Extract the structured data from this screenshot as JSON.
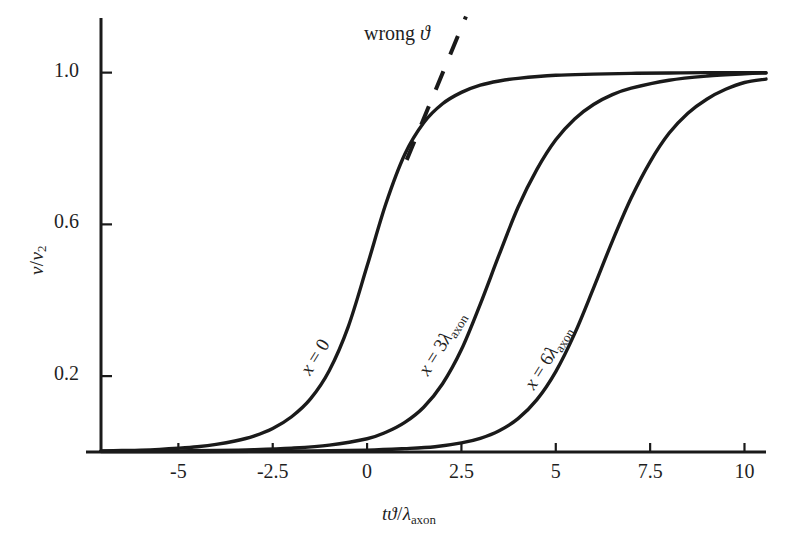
{
  "chart_data": {
    "type": "line",
    "title": "",
    "xlabel": "tϑ/λ_axon",
    "ylabel": "v/v_2",
    "xlim": [
      -7.05,
      10.57
    ],
    "ylim": [
      0.0,
      1.144
    ],
    "grid": false,
    "legend_position": "inline-curve-labels",
    "xticks": [
      -5,
      -2.5,
      0,
      2.5,
      5,
      7.5,
      10
    ],
    "xtick_labels": [
      "-5",
      "-2.5",
      "0",
      "2.5",
      "5",
      "7.5",
      "10"
    ],
    "yticks": [
      0.2,
      0.6,
      1.0
    ],
    "ytick_labels": [
      "0.2",
      "0.6",
      "1.0"
    ],
    "series": [
      {
        "name": "x = 0",
        "label": "x = 0",
        "style": "solid",
        "color": "#1a1a1a",
        "x": [
          -7.05,
          -6.5,
          -6.0,
          -5.5,
          -5.0,
          -4.5,
          -4.0,
          -3.5,
          -3.0,
          -2.5,
          -2.0,
          -1.5,
          -1.0,
          -0.5,
          0.0,
          0.5,
          1.0,
          1.5,
          2.0,
          2.5,
          3.0,
          3.5,
          4.0,
          5.0,
          6.0,
          7.0,
          8.0,
          9.0,
          10.0,
          10.57
        ],
        "y": [
          0.003,
          0.004,
          0.005,
          0.007,
          0.01,
          0.014,
          0.02,
          0.029,
          0.042,
          0.062,
          0.093,
          0.14,
          0.215,
          0.33,
          0.49,
          0.655,
          0.785,
          0.868,
          0.918,
          0.948,
          0.967,
          0.978,
          0.985,
          0.993,
          0.996,
          0.998,
          0.999,
          1.0,
          1.0,
          1.0
        ]
      },
      {
        "name": "x = 3λ_axon",
        "label": "x = 3λ_axon",
        "style": "solid",
        "color": "#1a1a1a",
        "x": [
          -7.05,
          -6.0,
          -5.0,
          -4.0,
          -3.0,
          -2.0,
          -1.0,
          0.0,
          0.5,
          1.0,
          1.5,
          2.0,
          2.5,
          3.0,
          3.5,
          4.0,
          4.5,
          5.0,
          5.5,
          6.0,
          6.5,
          7.0,
          8.0,
          9.0,
          10.0,
          10.57
        ],
        "y": [
          0.002,
          0.002,
          0.003,
          0.004,
          0.006,
          0.01,
          0.018,
          0.035,
          0.052,
          0.078,
          0.118,
          0.18,
          0.27,
          0.39,
          0.52,
          0.645,
          0.745,
          0.823,
          0.878,
          0.916,
          0.942,
          0.959,
          0.98,
          0.991,
          0.997,
          0.999
        ]
      },
      {
        "name": "x = 6λ_axon",
        "label": "x = 6λ_axon",
        "style": "solid",
        "color": "#1a1a1a",
        "x": [
          -7.05,
          -5.0,
          -3.0,
          -1.5,
          0.0,
          1.0,
          1.8,
          2.5,
          3.0,
          3.5,
          4.0,
          4.5,
          5.0,
          5.5,
          6.0,
          6.5,
          7.0,
          7.5,
          8.0,
          8.5,
          9.0,
          9.5,
          10.0,
          10.57
        ],
        "y": [
          0.001,
          0.001,
          0.002,
          0.003,
          0.005,
          0.009,
          0.014,
          0.024,
          0.036,
          0.056,
          0.088,
          0.138,
          0.212,
          0.312,
          0.432,
          0.556,
          0.67,
          0.765,
          0.84,
          0.893,
          0.93,
          0.956,
          0.974,
          0.983
        ]
      }
    ],
    "annotations": [
      {
        "name": "wrong-theta",
        "text": "wrong ϑ",
        "style": "dashed",
        "color": "#1a1a1a",
        "line_x": [
          1.05,
          2.62
        ],
        "line_y": [
          0.77,
          1.148
        ],
        "text_x": 0.4,
        "text_y": 1.125
      }
    ]
  },
  "axes": {
    "x_axis_name": "x-axis",
    "y_axis_name": "y-axis",
    "ylabel_parts": {
      "num": "v",
      "slash": "/",
      "den": "v",
      "den_sub": "2"
    },
    "xlabel_parts": {
      "t": "t",
      "theta": "ϑ",
      "slash": "/",
      "lambda": "λ",
      "lambda_sub": "axon"
    }
  },
  "curve_labels": [
    {
      "prefix": "x",
      "eq": "=",
      "value": "0",
      "lambda": "",
      "lambda_sub": ""
    },
    {
      "prefix": "x",
      "eq": "=",
      "value": "3",
      "lambda": "λ",
      "lambda_sub": "axon"
    },
    {
      "prefix": "x",
      "eq": "=",
      "value": "6",
      "lambda": "λ",
      "lambda_sub": "axon"
    }
  ],
  "xtick_labels": [
    "-5",
    "-2.5",
    "0",
    "2.5",
    "5",
    "7.5",
    "10"
  ],
  "ytick_labels": [
    "0.2",
    "0.6",
    "1.0"
  ],
  "annotation_text": {
    "word": "wrong",
    "symbol": "ϑ"
  },
  "colors": {
    "ink": "#1a1a1a",
    "background": "#ffffff"
  }
}
